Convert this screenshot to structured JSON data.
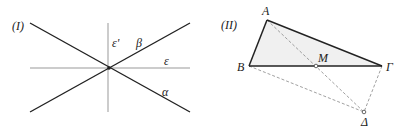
{
  "figure_I": {
    "label": "(I)",
    "lines": {
      "alpha": "α",
      "beta": "β",
      "epsilon": "ε",
      "epsilon_prime": "ε'"
    }
  },
  "figure_II": {
    "label": "(II)",
    "points": {
      "A": "A",
      "B": "B",
      "G": "Γ",
      "M": "M",
      "D": "Δ"
    }
  },
  "colors": {
    "bold_line": "#222222",
    "thin_line": "#999999",
    "fill": "#f0f0f0"
  }
}
